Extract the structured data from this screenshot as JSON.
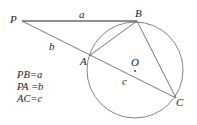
{
  "diagram": {
    "points": {
      "P": {
        "label": "P",
        "x": 22,
        "y": 21
      },
      "B": {
        "label": "B",
        "x": 137,
        "y": 21
      },
      "A": {
        "label": "A",
        "x": 89,
        "y": 56
      },
      "C": {
        "label": "C",
        "x": 176,
        "y": 98
      },
      "O": {
        "label": "O",
        "x": 135,
        "y": 70
      }
    },
    "circle": {
      "cx": 135,
      "cy": 70,
      "r": 48
    },
    "segment_labels": {
      "a": "a",
      "b": "b",
      "c": "c"
    },
    "equations": [
      "PB=a",
      "PA =b",
      "AC=c"
    ]
  }
}
